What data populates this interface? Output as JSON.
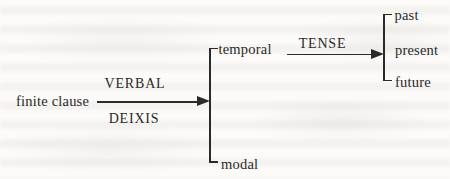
{
  "nodes": {
    "root": "finite clause",
    "deixis_types": [
      "temporal",
      "modal"
    ],
    "tense_options": [
      "past",
      "present",
      "future"
    ]
  },
  "edges": {
    "verbal_deixis": {
      "label_above": "VERBAL",
      "label_below": "DEIXIS"
    },
    "tense": {
      "label": "TENSE"
    }
  },
  "colors": {
    "ink": "#2a2a2a",
    "paper": "#fcfbf9"
  }
}
